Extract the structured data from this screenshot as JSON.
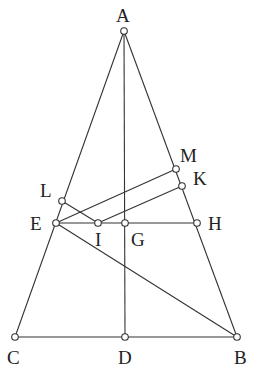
{
  "diagram": {
    "type": "geometry",
    "points": {
      "A": {
        "label": "A",
        "x": 124,
        "y": 31
      },
      "B": {
        "label": "B",
        "x": 237,
        "y": 337
      },
      "C": {
        "label": "C",
        "x": 15,
        "y": 337
      },
      "D": {
        "label": "D",
        "x": 125,
        "y": 337
      },
      "E": {
        "label": "E",
        "x": 56,
        "y": 223
      },
      "G": {
        "label": "G",
        "x": 125,
        "y": 223
      },
      "H": {
        "label": "H",
        "x": 197,
        "y": 223
      },
      "I": {
        "label": "I",
        "x": 98,
        "y": 223
      },
      "L": {
        "label": "L",
        "x": 62,
        "y": 201
      },
      "M": {
        "label": "M",
        "x": 176,
        "y": 169
      },
      "K": {
        "label": "K",
        "x": 182,
        "y": 186
      }
    },
    "segments": [
      [
        "A",
        "C"
      ],
      [
        "A",
        "B"
      ],
      [
        "C",
        "B"
      ],
      [
        "A",
        "D"
      ],
      [
        "E",
        "H"
      ],
      [
        "E",
        "B"
      ],
      [
        "E",
        "M"
      ],
      [
        "L",
        "I"
      ],
      [
        "I",
        "K"
      ]
    ],
    "labels": {
      "A": "A",
      "B": "B",
      "C": "C",
      "D": "D",
      "E": "E",
      "G": "G",
      "H": "H",
      "I": "I",
      "L": "L",
      "M": "M",
      "K": "K"
    }
  }
}
